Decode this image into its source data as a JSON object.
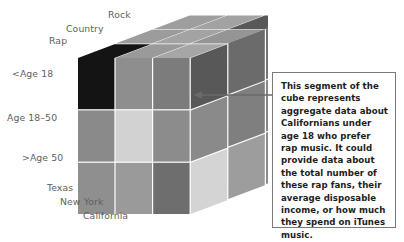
{
  "figure": {
    "type": "cube-diagram",
    "cutoff_header": "FIGURE 9-10  A data cube for an online music retailer",
    "callout": {
      "text": "This segment of the cube represents aggregate data about Californians under age 18 who prefer rap music. It could provide data about the total number of these rap fans, their average disposable income, or how much they spend on iTunes music."
    },
    "axes": {
      "genre": {
        "name": "Genre",
        "labels": [
          "Rap",
          "Country",
          "Rock"
        ]
      },
      "age": {
        "name": "Age",
        "labels": [
          "<Age 18",
          "Age 18–50",
          ">Age 50"
        ]
      },
      "state": {
        "name": "State",
        "labels": [
          "Texas",
          "New York",
          "California"
        ]
      }
    },
    "highlighted_cell": {
      "genre": "Rap",
      "age": "<Age 18",
      "state": "California",
      "color": "#141414"
    },
    "colors": {
      "front": [
        [
          "#141414",
          "#8e8e8e",
          "#7c7c7c"
        ],
        [
          "#8a8a8a",
          "#d2d2d2",
          "#8c8c8c"
        ],
        [
          "#8f8f8f",
          "#9a9a9a",
          "#6e6e6e"
        ]
      ],
      "top": [
        [
          "#141414",
          "#9c9c9c",
          "#a6a6a6"
        ],
        [
          "#9e9e9e",
          "#a3a3a3",
          "#9a9a9a"
        ],
        [
          "#a2a2a2",
          "#959595",
          "#585858"
        ]
      ],
      "side": [
        [
          "#585858",
          "#6b6b6b",
          "#747474"
        ],
        [
          "#8a8a8a",
          "#7f7f7f",
          "#868686"
        ],
        [
          "#d4d4d4",
          "#9d9d9d",
          "#8c8c8c"
        ]
      ],
      "grout": "#ffffff",
      "label_text": "#5f5f5f",
      "callout_border": "#7b7b7b",
      "callout_text": "#1d1d1d",
      "arrow": "#6a6a6a"
    },
    "arrow": {
      "from_x": 272,
      "from_y": 95,
      "to_x": 196,
      "to_y": 95
    }
  }
}
